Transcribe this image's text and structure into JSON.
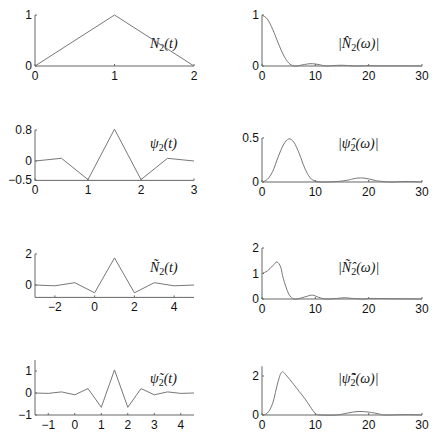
{
  "chart_data": [
    {
      "id": "N2_t",
      "type": "line",
      "title": "N_2(t)",
      "xlim": [
        0,
        2
      ],
      "ylim": [
        0,
        1
      ],
      "xticks": [
        "0",
        "1",
        "2"
      ],
      "yticks": [
        "0",
        "1"
      ],
      "x": [
        0,
        1,
        2
      ],
      "y": [
        0,
        1,
        0
      ],
      "px": {
        "x0": 35,
        "x1": 194,
        "y0": 66,
        "y1": 15
      }
    },
    {
      "id": "N2_hat",
      "type": "line",
      "title": "|N̂_2(ω)|",
      "xlim": [
        0,
        30
      ],
      "ylim": [
        0,
        1
      ],
      "xticks": [
        "0",
        "10",
        "20",
        "30"
      ],
      "yticks": [
        "0",
        "1"
      ],
      "x": [
        0,
        1,
        2,
        3,
        4,
        5,
        6,
        7,
        8,
        9,
        10,
        11,
        12,
        13,
        14,
        15,
        16,
        17,
        18,
        19,
        20,
        22,
        25,
        28,
        30
      ],
      "y": [
        1.0,
        0.92,
        0.72,
        0.46,
        0.22,
        0.06,
        0.0,
        0.01,
        0.03,
        0.045,
        0.04,
        0.02,
        0.0,
        0.005,
        0.012,
        0.015,
        0.01,
        0.002,
        0.0,
        0.004,
        0.006,
        0.003,
        0.003,
        0.002,
        0.0
      ],
      "px": {
        "x0": 262,
        "x1": 422,
        "y0": 66,
        "y1": 15
      }
    },
    {
      "id": "psi2_t",
      "type": "line",
      "title": "ψ_2(t)",
      "xlim": [
        0,
        3
      ],
      "ylim": [
        -0.5,
        0.8
      ],
      "xticks": [
        "0",
        "1",
        "2",
        "3"
      ],
      "yticks": [
        "-0.5",
        "0",
        "0.8"
      ],
      "x": [
        0,
        0.5,
        1,
        1.5,
        2,
        2.5,
        3
      ],
      "y": [
        0,
        0.07,
        -0.48,
        0.82,
        -0.48,
        0.07,
        0
      ],
      "px": {
        "x0": 35,
        "x1": 194,
        "y0": 161,
        "y1": 130,
        "yref0": 0,
        "yref1": 0.8
      }
    },
    {
      "id": "psi2_hat",
      "type": "line",
      "title": "|ψ̂_2(ω)|",
      "xlim": [
        0,
        30
      ],
      "ylim": [
        0,
        0.5
      ],
      "xticks": [
        "0",
        "10",
        "20",
        "30"
      ],
      "yticks": [
        "0",
        "0.5"
      ],
      "x": [
        0,
        1,
        2,
        3,
        4,
        5,
        6,
        7,
        8,
        9,
        10,
        11,
        12,
        14,
        16,
        17,
        18,
        19,
        20,
        21,
        22,
        24,
        27,
        30
      ],
      "y": [
        0.0,
        0.03,
        0.12,
        0.28,
        0.42,
        0.49,
        0.45,
        0.32,
        0.16,
        0.05,
        0.01,
        0.0,
        0.0,
        0.005,
        0.02,
        0.035,
        0.045,
        0.045,
        0.035,
        0.02,
        0.01,
        0.0,
        0.005,
        0.0
      ],
      "px": {
        "x0": 262,
        "x1": 422,
        "y0": 182,
        "y1": 138
      }
    },
    {
      "id": "N2_tilde_t",
      "type": "line",
      "title": "Ñ_2(t)",
      "xlim": [
        -3,
        5
      ],
      "ylim": [
        -0.8,
        2
      ],
      "xticks": [
        "-2",
        "0",
        "2",
        "4"
      ],
      "yticks": [
        "0",
        "2"
      ],
      "x": [
        -3,
        -2,
        -1,
        0,
        1,
        2,
        3,
        4,
        5
      ],
      "y": [
        0,
        -0.05,
        0.15,
        -0.5,
        1.75,
        -0.5,
        0.15,
        -0.05,
        0
      ],
      "px": {
        "x0": 35,
        "x1": 194,
        "y0": 285,
        "y1": 254,
        "yref0": 0,
        "yref1": 2
      }
    },
    {
      "id": "N2_tilde_hat",
      "type": "line",
      "title": "|Ñ̂_2(ω)|",
      "xlim": [
        0,
        30
      ],
      "ylim": [
        0,
        2
      ],
      "xticks": [
        "0",
        "10",
        "20",
        "30"
      ],
      "yticks": [
        "0",
        "1",
        "2"
      ],
      "x": [
        0,
        1,
        2,
        2.8,
        3.5,
        4,
        5,
        6,
        7,
        8,
        9,
        9.5,
        10,
        11,
        12,
        14,
        15.5,
        17,
        19,
        20,
        22,
        25,
        30
      ],
      "y": [
        1.0,
        1.1,
        1.3,
        1.45,
        1.25,
        0.8,
        0.2,
        0.0,
        0.02,
        0.08,
        0.14,
        0.15,
        0.12,
        0.04,
        0.0,
        0.02,
        0.05,
        0.02,
        0.0,
        0.02,
        0.02,
        0.01,
        0.0
      ],
      "px": {
        "x0": 262,
        "x1": 422,
        "y0": 299,
        "y1": 248
      }
    },
    {
      "id": "psi2_tilde_t",
      "type": "line",
      "title": "ψ̃_2(t)",
      "xlim": [
        -1.5,
        4.5
      ],
      "ylim": [
        -1,
        1.5
      ],
      "xticks": [
        "-1",
        "0",
        "1",
        "2",
        "3",
        "4"
      ],
      "yticks": [
        "-1",
        "0",
        "1"
      ],
      "x": [
        -1.5,
        -1,
        -0.5,
        0,
        0.5,
        1,
        1.5,
        2,
        2.5,
        3,
        3.5,
        4,
        4.5
      ],
      "y": [
        0,
        -0.02,
        0.05,
        -0.08,
        0.2,
        -0.65,
        1.05,
        -0.65,
        0.2,
        -0.08,
        0.05,
        -0.02,
        0
      ],
      "px": {
        "x0": 35,
        "x1": 194,
        "y0": 393,
        "y1": 371,
        "yref0": 0,
        "yref1": 1,
        "ybottom": 415
      }
    },
    {
      "id": "psi2_tilde_hat",
      "type": "line",
      "title": "|ψ̃̂_2(ω)|",
      "xlim": [
        0,
        30
      ],
      "ylim": [
        0,
        2.5
      ],
      "xticks": [
        "0",
        "10",
        "20",
        "30"
      ],
      "yticks": [
        "0",
        "2"
      ],
      "x": [
        0,
        1,
        2,
        3,
        3.7,
        4.5,
        6,
        7,
        8,
        9,
        10,
        11,
        14,
        16,
        18,
        20,
        22,
        23,
        27,
        30
      ],
      "y": [
        0,
        0.1,
        0.6,
        1.7,
        2.2,
        2.05,
        1.55,
        1.2,
        0.85,
        0.45,
        0.08,
        0.0,
        0.0,
        0.1,
        0.18,
        0.15,
        0.05,
        0.0,
        0.02,
        0.0
      ],
      "px": {
        "x0": 262,
        "x1": 422,
        "y0": 415,
        "y1": 376,
        "yref0": 0,
        "yref1": 2
      }
    }
  ],
  "labels": {
    "N2_t": "N",
    "sub": "2",
    "t_arg": "(t)",
    "w_arg": "(ω)",
    "psi": "ψ",
    "bar": "|"
  }
}
